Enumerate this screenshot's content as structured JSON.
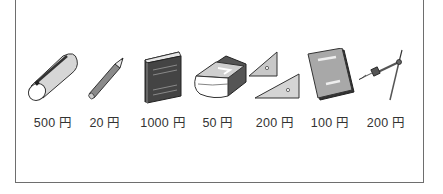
{
  "items": [
    {
      "name": "pencil-case",
      "icon": "pencil-case-icon",
      "price": "500 円"
    },
    {
      "name": "pencil",
      "icon": "pencil-icon",
      "price": "20 円"
    },
    {
      "name": "book",
      "icon": "book-icon",
      "price": "1000 円"
    },
    {
      "name": "eraser",
      "icon": "eraser-icon",
      "price": "50 円"
    },
    {
      "name": "triangle-rulers",
      "icon": "triangle-ruler-icon",
      "price": "200 円"
    },
    {
      "name": "notebook",
      "icon": "notebook-icon",
      "price": "100 円"
    },
    {
      "name": "compass",
      "icon": "compass-icon",
      "price": "200 円"
    }
  ]
}
